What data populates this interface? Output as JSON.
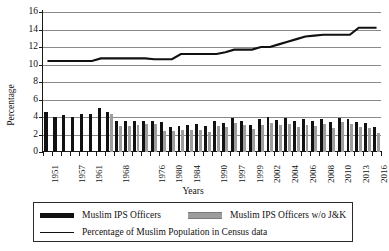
{
  "chart_data": {
    "type": "bar",
    "title": "",
    "xlabel": "Years",
    "ylabel": "Percentage",
    "ylim": [
      0,
      16
    ],
    "ytick_step": 2,
    "yticks": [
      0,
      2,
      4,
      6,
      8,
      10,
      12,
      14,
      16
    ],
    "grid": true,
    "legend_position": "bottom",
    "categories": [
      "1951",
      "1953",
      "1955",
      "1957",
      "1959",
      "1961",
      "1964",
      "1966",
      "1968",
      "1970",
      "1972",
      "1974",
      "1976",
      "1978",
      "1980",
      "1982",
      "1984",
      "1986",
      "1988",
      "1990",
      "1994",
      "1997",
      "1998",
      "1999",
      "2001",
      "2002",
      "2003",
      "2004",
      "2005",
      "2006",
      "2007",
      "2008",
      "2009",
      "2010",
      "2011",
      "2013",
      "2014",
      "2016"
    ],
    "xtick_labels": [
      "1951",
      "1957",
      "1961",
      "1968",
      "1976",
      "1980",
      "1984",
      "1990",
      "1997",
      "1999",
      "2002",
      "2004",
      "2006",
      "2008",
      "2010",
      "2013",
      "2016"
    ],
    "series": [
      {
        "name": "Muslim IPS Officers",
        "kind": "bar",
        "color": "#111111",
        "values": [
          4.6,
          4.0,
          4.2,
          4.0,
          4.3,
          4.4,
          5.0,
          4.6,
          3.6,
          3.6,
          3.5,
          3.6,
          3.5,
          3.4,
          2.9,
          3.0,
          3.1,
          3.2,
          3.0,
          3.5,
          3.3,
          3.9,
          3.6,
          3.1,
          3.8,
          4.0,
          3.7,
          3.9,
          3.5,
          3.8,
          3.6,
          3.8,
          3.4,
          3.9,
          3.8,
          3.4,
          3.3,
          2.9
        ]
      },
      {
        "name": "Muslim IPS Officers w/o J&K",
        "kind": "bar",
        "color": "#9d9d9d",
        "values": [
          null,
          null,
          null,
          null,
          null,
          null,
          null,
          4.3,
          3.0,
          3.0,
          3.1,
          3.2,
          3.2,
          2.4,
          2.4,
          2.5,
          2.5,
          2.5,
          2.3,
          3.0,
          2.9,
          3.3,
          3.1,
          2.6,
          3.1,
          3.3,
          3.1,
          3.2,
          2.9,
          3.1,
          3.0,
          3.2,
          2.8,
          3.4,
          3.2,
          2.9,
          2.8,
          2.2
        ]
      },
      {
        "name": "Percentage of Muslim Population in Census data",
        "kind": "line",
        "color": "#111111",
        "values": [
          10.4,
          10.4,
          10.4,
          10.4,
          10.4,
          10.4,
          10.7,
          10.7,
          10.7,
          10.7,
          10.7,
          10.7,
          10.6,
          10.6,
          10.6,
          11.2,
          11.2,
          11.2,
          11.2,
          11.2,
          11.4,
          11.7,
          11.7,
          11.7,
          12.0,
          12.0,
          12.3,
          12.6,
          12.9,
          13.2,
          13.3,
          13.4,
          13.4,
          13.4,
          13.4,
          14.2,
          14.2,
          14.2
        ]
      }
    ]
  },
  "legend": {
    "items": [
      {
        "label": "Muslim IPS Officers",
        "swatch": "black-bar-swatch"
      },
      {
        "label": "Muslim IPS Officers w/o J&K",
        "swatch": "grey-bar-swatch"
      },
      {
        "label": "Percentage of Muslim Population in Census data",
        "swatch": "black-line-swatch"
      }
    ]
  }
}
